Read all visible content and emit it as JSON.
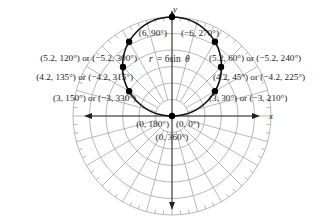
{
  "figure": {
    "equation": "r = 6sin θ",
    "equation_parts": {
      "lhs": "r",
      "eq": "= 6sin",
      "theta": "θ"
    },
    "axes": {
      "x_label": "x",
      "y_label": "y"
    },
    "colors": {
      "curve": "#111111",
      "grid": "#9a9a9a",
      "axes": "#222222",
      "points": "#000000",
      "text": "#222222"
    },
    "points": [
      {
        "label": "(6, 90°)",
        "r": 6,
        "theta": 90
      },
      {
        "label": "(−6, 270°)",
        "r": -6,
        "theta": 270
      },
      {
        "label": "(5.2, 120°) or (−5.2, 300°)",
        "r": 5.2,
        "theta": 120
      },
      {
        "label": "(5.2, 60°) or (−5.2, 240°)",
        "r": 5.2,
        "theta": 60
      },
      {
        "label": "(4.2, 135°) or (−4.2, 315°)",
        "r": 4.2,
        "theta": 135
      },
      {
        "label": "(4.2, 45°) or (−4.2, 225°)",
        "r": 4.2,
        "theta": 45
      },
      {
        "label": "(3, 150°) or (−3, 330°)",
        "r": 3,
        "theta": 150
      },
      {
        "label": "(3, 30°) or (−3, 210°)",
        "r": 3,
        "theta": 30
      },
      {
        "label": "(0, 180°)",
        "r": 0,
        "theta": 180
      },
      {
        "label": "(0, 0°)",
        "r": 0,
        "theta": 0
      },
      {
        "label": "(0, 360°)",
        "r": 0,
        "theta": 360
      }
    ]
  }
}
